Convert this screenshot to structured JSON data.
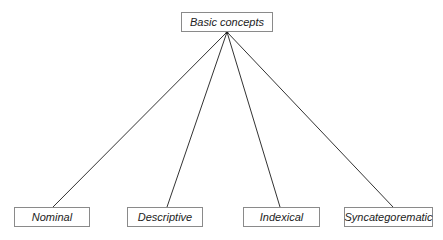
{
  "diagram": {
    "type": "tree",
    "root": {
      "id": "root",
      "label": "Basic concepts"
    },
    "children": [
      {
        "id": "nominal",
        "label": "Nominal"
      },
      {
        "id": "descriptive",
        "label": "Descriptive"
      },
      {
        "id": "indexical",
        "label": "Indexical"
      },
      {
        "id": "syncategorematic",
        "label": "Syncategorematic"
      }
    ],
    "edges": [
      [
        "root",
        "nominal"
      ],
      [
        "root",
        "descriptive"
      ],
      [
        "root",
        "indexical"
      ],
      [
        "root",
        "syncategorematic"
      ]
    ]
  }
}
